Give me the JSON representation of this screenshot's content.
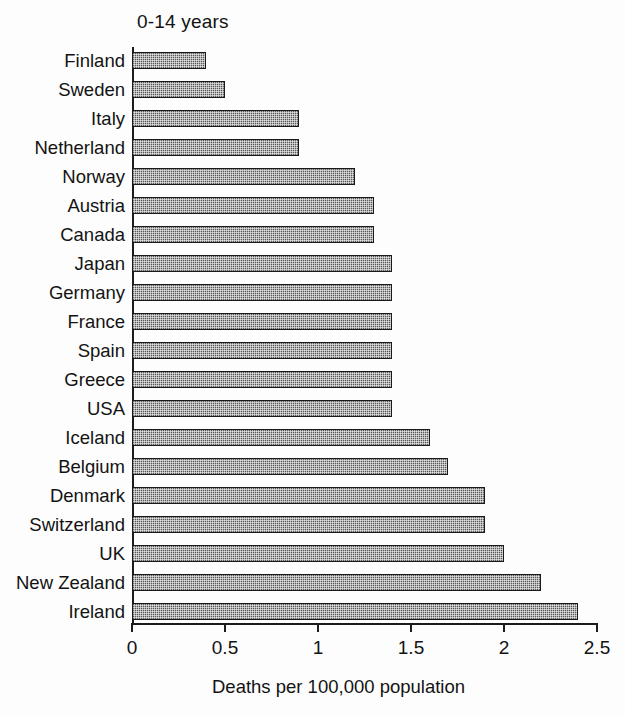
{
  "chart_data": {
    "type": "bar",
    "orientation": "horizontal",
    "title": "0-14 years",
    "xlabel": "Deaths per 100,000 population",
    "ylabel": "",
    "xlim": [
      0,
      2.5
    ],
    "xticks": [
      "0",
      "0.5",
      "1",
      "1.5",
      "2",
      "2.5"
    ],
    "xtick_values": [
      0,
      0.5,
      1,
      1.5,
      2,
      2.5
    ],
    "grid": false,
    "legend": null,
    "categories": [
      "Finland",
      "Sweden",
      "Italy",
      "Netherland",
      "Norway",
      "Austria",
      "Canada",
      "Japan",
      "Germany",
      "France",
      "Spain",
      "Greece",
      "USA",
      "Iceland",
      "Belgium",
      "Denmark",
      "Switzerland",
      "UK",
      "New Zealand",
      "Ireland"
    ],
    "values": [
      0.4,
      0.5,
      0.9,
      0.9,
      1.2,
      1.3,
      1.3,
      1.4,
      1.4,
      1.4,
      1.4,
      1.4,
      1.4,
      1.6,
      1.7,
      1.9,
      1.9,
      2.0,
      2.2,
      2.4
    ],
    "bar_fill": "#5a5a5a",
    "bar_edge": "#1a1a1a",
    "axis_color": "#1c1c1c",
    "background": "#fdfdfd"
  }
}
